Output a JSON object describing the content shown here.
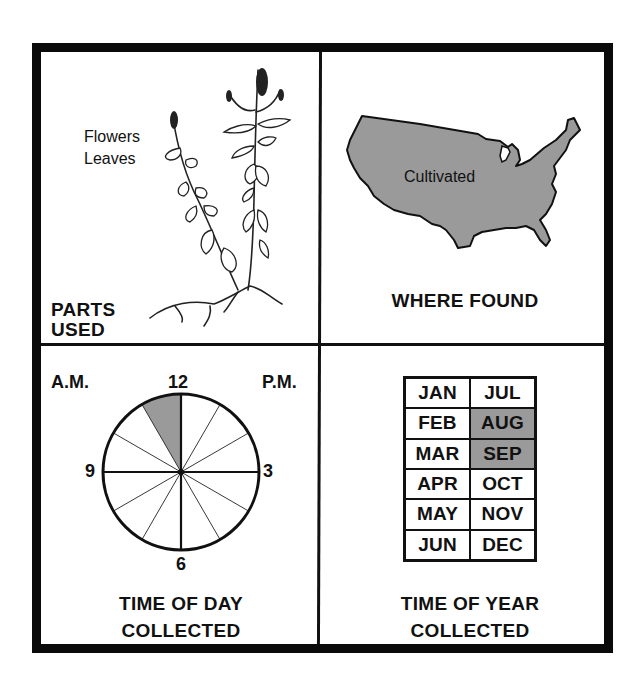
{
  "panels": {
    "parts_used": {
      "title_line1": "PARTS",
      "title_line2": "USED",
      "items": [
        "Flowers",
        "Leaves"
      ],
      "illustration": "mint-plant-illustration"
    },
    "where_found": {
      "title": "WHERE FOUND",
      "map_region": "United States",
      "map_label": "Cultivated",
      "fill_color": "#9a9a9a"
    },
    "time_of_day": {
      "title_line1": "TIME OF DAY",
      "title_line2": "COLLECTED",
      "am_label": "A.M.",
      "pm_label": "P.M.",
      "hour_labels": {
        "top": "12",
        "right": "3",
        "bottom": "6",
        "left": "9"
      },
      "highlighted_segments": [
        {
          "from_hour": 11,
          "to_hour": 12,
          "period": "A.M."
        }
      ],
      "fill_color": "#9a9a9a"
    },
    "time_of_year": {
      "title_line1": "TIME OF YEAR",
      "title_line2": "COLLECTED",
      "months": [
        {
          "label": "JAN",
          "active": false
        },
        {
          "label": "JUL",
          "active": false
        },
        {
          "label": "FEB",
          "active": false
        },
        {
          "label": "AUG",
          "active": true
        },
        {
          "label": "MAR",
          "active": false
        },
        {
          "label": "SEP",
          "active": true
        },
        {
          "label": "APR",
          "active": false
        },
        {
          "label": "OCT",
          "active": false
        },
        {
          "label": "MAY",
          "active": false
        },
        {
          "label": "NOV",
          "active": false
        },
        {
          "label": "JUN",
          "active": false
        },
        {
          "label": "DEC",
          "active": false
        }
      ],
      "fill_color": "#9a9a9a"
    }
  }
}
